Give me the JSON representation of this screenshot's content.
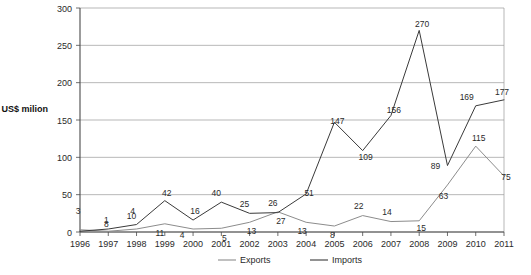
{
  "chart_data": {
    "type": "line",
    "title": "",
    "xlabel": "",
    "ylabel": "US$ milion",
    "ylim": [
      0,
      300
    ],
    "ytick_step": 50,
    "yticks": [
      0,
      50,
      100,
      150,
      200,
      250,
      300
    ],
    "grid": true,
    "legend_position": "bottom",
    "categories": [
      "1996",
      "1997",
      "1998",
      "1999",
      "2000",
      "2001",
      "2002",
      "2003",
      "2004",
      "2005",
      "2006",
      "2007",
      "2008",
      "2009",
      "2010",
      "2011"
    ],
    "series": [
      {
        "name": "Exports",
        "color": "#8c8c8c",
        "values": [
          3,
          1,
          4,
          11,
          4,
          5,
          13,
          27,
          13,
          8,
          22,
          14,
          15,
          63,
          115,
          75
        ]
      },
      {
        "name": "Imports",
        "color": "#3a3a3a",
        "values": [
          1,
          4,
          10,
          42,
          16,
          40,
          25,
          26,
          51,
          147,
          109,
          156,
          270,
          89,
          169,
          177
        ]
      }
    ],
    "point_labels": [
      {
        "series": "Exports",
        "category": "1996",
        "value": 3,
        "text": "3",
        "dx": -2,
        "dy": -16
      },
      {
        "series": "Exports",
        "category": "1997",
        "value": 1,
        "text": "1",
        "dx": -2,
        "dy": -8
      },
      {
        "series": "Exports",
        "category": "1998",
        "value": 4,
        "text": "4",
        "dx": -4,
        "dy": -15
      },
      {
        "series": "Exports",
        "category": "1999",
        "value": 11,
        "text": "11",
        "dx": -5,
        "dy": 12
      },
      {
        "series": "Exports",
        "category": "2000",
        "value": 4,
        "text": "4",
        "dx": -11,
        "dy": 9
      },
      {
        "series": "Exports",
        "category": "2001",
        "value": 5,
        "text": "5",
        "dx": 3,
        "dy": 13
      },
      {
        "series": "Exports",
        "category": "2002",
        "value": 13,
        "text": "13",
        "dx": 2,
        "dy": 12
      },
      {
        "series": "Exports",
        "category": "2003",
        "value": 27,
        "text": "27",
        "dx": 3,
        "dy": 12
      },
      {
        "series": "Exports",
        "category": "2004",
        "value": 13,
        "text": "13",
        "dx": -4,
        "dy": 12
      },
      {
        "series": "Exports",
        "category": "2005",
        "value": 8,
        "text": "8",
        "dx": -2,
        "dy": 12
      },
      {
        "series": "Exports",
        "category": "2006",
        "value": 22,
        "text": "22",
        "dx": -4,
        "dy": -7
      },
      {
        "series": "Exports",
        "category": "2007",
        "value": 14,
        "text": "14",
        "dx": -4,
        "dy": -7
      },
      {
        "series": "Exports",
        "category": "2008",
        "value": 15,
        "text": "15",
        "dx": 2,
        "dy": 10
      },
      {
        "series": "Exports",
        "category": "2009",
        "value": 63,
        "text": "63",
        "dx": -4,
        "dy": 14
      },
      {
        "series": "Exports",
        "category": "2010",
        "value": 115,
        "text": "115",
        "dx": 3,
        "dy": -5
      },
      {
        "series": "Exports",
        "category": "2011",
        "value": 75,
        "text": "75",
        "dx": 2,
        "dy": 4
      },
      {
        "series": "Imports",
        "category": "1998",
        "value": 10,
        "text": "10",
        "dx": -5,
        "dy": -6
      },
      {
        "series": "Imports",
        "category": "1997",
        "value": 4,
        "text": "8",
        "dx": -2,
        "dy": -2
      },
      {
        "series": "Imports",
        "category": "1999",
        "value": 42,
        "text": "42",
        "dx": 2,
        "dy": -5
      },
      {
        "series": "Imports",
        "category": "2000",
        "value": 16,
        "text": "16",
        "dx": 2,
        "dy": -6
      },
      {
        "series": "Imports",
        "category": "2001",
        "value": 40,
        "text": "40",
        "dx": -5,
        "dy": -6
      },
      {
        "series": "Imports",
        "category": "2002",
        "value": 25,
        "text": "25",
        "dx": -5,
        "dy": -6
      },
      {
        "series": "Imports",
        "category": "2003",
        "value": 26,
        "text": "26",
        "dx": -5,
        "dy": -7
      },
      {
        "series": "Imports",
        "category": "2004",
        "value": 51,
        "text": "51",
        "dx": 3,
        "dy": 2
      },
      {
        "series": "Imports",
        "category": "2005",
        "value": 147,
        "text": "147",
        "dx": 3,
        "dy": 2
      },
      {
        "series": "Imports",
        "category": "2006",
        "value": 109,
        "text": "109",
        "dx": 3,
        "dy": 9
      },
      {
        "series": "Imports",
        "category": "2007",
        "value": 156,
        "text": "156",
        "dx": 3,
        "dy": -3
      },
      {
        "series": "Imports",
        "category": "2008",
        "value": 270,
        "text": "270",
        "dx": 3,
        "dy": -3
      },
      {
        "series": "Imports",
        "category": "2009",
        "value": 89,
        "text": "89",
        "dx": -12,
        "dy": 3
      },
      {
        "series": "Imports",
        "category": "2010",
        "value": 169,
        "text": "169",
        "dx": -9,
        "dy": -6
      },
      {
        "series": "Imports",
        "category": "2011",
        "value": 177,
        "text": "177",
        "dx": -2,
        "dy": -5
      }
    ]
  },
  "legend": {
    "items": [
      {
        "label": "Exports",
        "color": "#8c8c8c"
      },
      {
        "label": "Imports",
        "color": "#3a3a3a"
      }
    ]
  },
  "axis": {
    "y_title": "US$ milion",
    "y_tick_labels": [
      "300",
      "250",
      "200",
      "150",
      "100",
      "50",
      "0"
    ],
    "x_tick_labels": [
      "1996",
      "1997",
      "1998",
      "1999",
      "2000",
      "2001",
      "2002",
      "2003",
      "2004",
      "2005",
      "2006",
      "2007",
      "2008",
      "2009",
      "2010",
      "2011"
    ]
  }
}
